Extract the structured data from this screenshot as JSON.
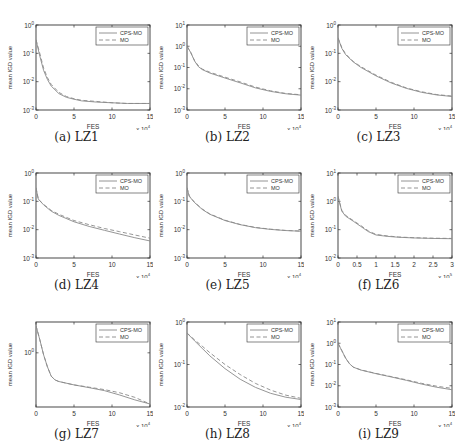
{
  "figure": {
    "line_colors": {
      "CPS-MO": "#8a8a8a",
      "MO": "#8a8a8a"
    },
    "axis_color": "#333333"
  },
  "chart_data": [
    {
      "id": "LZ1",
      "caption": "(a) LZ1",
      "type": "line",
      "xlabel": "FES",
      "ylabel": "mean IGD value",
      "x_multiplier": "x 10^4",
      "xlim": [
        0,
        15
      ],
      "xticks": [
        0,
        5,
        10,
        15
      ],
      "yscale": "log",
      "ylim": [
        0.001,
        1
      ],
      "yticks": [
        "10^0",
        "10^-1",
        "10^-2",
        "10^-3"
      ],
      "legend": [
        "CPS-MO",
        "MO"
      ],
      "legend_position": "upper right",
      "x": [
        0,
        0.5,
        1,
        1.5,
        2,
        3,
        4,
        5,
        6,
        8,
        10,
        12,
        15
      ],
      "series": [
        {
          "name": "CPS-MO",
          "style": "solid",
          "values": [
            0.3,
            0.08,
            0.025,
            0.012,
            0.007,
            0.0038,
            0.0028,
            0.0024,
            0.0021,
            0.0019,
            0.0018,
            0.0017,
            0.0017
          ]
        },
        {
          "name": "MO",
          "style": "dashed",
          "values": [
            0.3,
            0.1,
            0.03,
            0.014,
            0.008,
            0.0042,
            0.003,
            0.0025,
            0.0022,
            0.002,
            0.0018,
            0.0017,
            0.0017
          ]
        }
      ]
    },
    {
      "id": "LZ2",
      "caption": "(b) LZ2",
      "type": "line",
      "xlabel": "FES",
      "ylabel": "mean IGD value",
      "x_multiplier": "x 10^4",
      "xlim": [
        0,
        15
      ],
      "xticks": [
        0,
        5,
        10,
        15
      ],
      "yscale": "log",
      "ylim": [
        0.001,
        10
      ],
      "yticks": [
        "10^1",
        "10^0",
        "10^-1",
        "10^-2",
        "10^-3"
      ],
      "legend": [
        "CPS-MO",
        "MO"
      ],
      "legend_position": "upper right",
      "x": [
        0,
        0.5,
        1,
        1.5,
        2,
        3,
        5,
        7,
        9,
        11,
        13,
        15
      ],
      "series": [
        {
          "name": "CPS-MO",
          "style": "solid",
          "values": [
            1.0,
            0.5,
            0.2,
            0.11,
            0.08,
            0.055,
            0.032,
            0.019,
            0.011,
            0.0075,
            0.0058,
            0.005
          ]
        },
        {
          "name": "MO",
          "style": "dashed",
          "values": [
            1.0,
            0.5,
            0.21,
            0.12,
            0.085,
            0.06,
            0.035,
            0.021,
            0.012,
            0.008,
            0.006,
            0.0052
          ]
        }
      ]
    },
    {
      "id": "LZ3",
      "caption": "(c) LZ3",
      "type": "line",
      "xlabel": "FES",
      "ylabel": "mean IGD value",
      "x_multiplier": "x 10^4",
      "xlim": [
        0,
        15
      ],
      "xticks": [
        0,
        5,
        10,
        15
      ],
      "yscale": "log",
      "ylim": [
        0.001,
        1
      ],
      "yticks": [
        "10^0",
        "10^-1",
        "10^-2",
        "10^-3"
      ],
      "legend": [
        "CPS-MO",
        "MO"
      ],
      "legend_position": "upper right",
      "x": [
        0,
        0.5,
        1,
        2,
        3,
        5,
        7,
        9,
        11,
        13,
        15
      ],
      "series": [
        {
          "name": "CPS-MO",
          "style": "solid",
          "values": [
            0.35,
            0.15,
            0.09,
            0.05,
            0.032,
            0.016,
            0.009,
            0.0058,
            0.0042,
            0.0034,
            0.003
          ]
        },
        {
          "name": "MO",
          "style": "dashed",
          "values": [
            0.35,
            0.16,
            0.095,
            0.052,
            0.034,
            0.017,
            0.0095,
            0.006,
            0.0044,
            0.0035,
            0.0031
          ]
        }
      ]
    },
    {
      "id": "LZ4",
      "caption": "(d) LZ4",
      "type": "line",
      "xlabel": "FES",
      "ylabel": "mean IGD value",
      "x_multiplier": "x 10^4",
      "xlim": [
        0,
        15
      ],
      "xticks": [
        0,
        5,
        10,
        15
      ],
      "yscale": "log",
      "ylim": [
        0.001,
        1
      ],
      "yticks": [
        "10^0",
        "10^-1",
        "10^-2",
        "10^-3"
      ],
      "legend": [
        "CPS-MO",
        "MO"
      ],
      "legend_position": "upper right",
      "x": [
        0,
        0.3,
        1,
        2,
        3,
        5,
        7,
        9,
        11,
        13,
        15
      ],
      "series": [
        {
          "name": "CPS-MO",
          "style": "solid",
          "values": [
            0.3,
            0.12,
            0.075,
            0.045,
            0.032,
            0.019,
            0.013,
            0.0095,
            0.007,
            0.0052,
            0.004
          ]
        },
        {
          "name": "MO",
          "style": "dashed",
          "values": [
            0.3,
            0.12,
            0.078,
            0.048,
            0.035,
            0.021,
            0.015,
            0.011,
            0.0085,
            0.0065,
            0.005
          ]
        }
      ]
    },
    {
      "id": "LZ5",
      "caption": "(e) LZ5",
      "type": "line",
      "xlabel": "FES",
      "ylabel": "mean IGD value",
      "x_multiplier": "x 10^4",
      "xlim": [
        0,
        15
      ],
      "xticks": [
        0,
        5,
        10,
        15
      ],
      "yscale": "log",
      "ylim": [
        0.001,
        1
      ],
      "yticks": [
        "10^0",
        "10^-1",
        "10^-2",
        "10^-3"
      ],
      "legend": [
        "CPS-MO",
        "MO"
      ],
      "legend_position": "upper right",
      "x": [
        0,
        0.3,
        1,
        2,
        3,
        5,
        7,
        9,
        11,
        13,
        15
      ],
      "series": [
        {
          "name": "CPS-MO",
          "style": "solid",
          "values": [
            0.3,
            0.15,
            0.09,
            0.052,
            0.035,
            0.021,
            0.015,
            0.0118,
            0.0102,
            0.0093,
            0.0088
          ]
        },
        {
          "name": "MO",
          "style": "dashed",
          "values": [
            0.3,
            0.155,
            0.092,
            0.054,
            0.036,
            0.0215,
            0.0153,
            0.012,
            0.0104,
            0.0094,
            0.0089
          ]
        }
      ]
    },
    {
      "id": "LZ6",
      "caption": "(f) LZ6",
      "type": "line",
      "xlabel": "FES",
      "ylabel": "mean IGD value",
      "x_multiplier": "x 10^5",
      "xlim": [
        0,
        3
      ],
      "xticks": [
        0,
        0.5,
        1,
        1.5,
        2,
        2.5,
        3
      ],
      "yscale": "log",
      "ylim": [
        0.01,
        10
      ],
      "yticks": [
        "10^1",
        "10^0",
        "10^-1",
        "10^-2"
      ],
      "legend": [
        "CPS-MO",
        "MO"
      ],
      "legend_position": "upper right",
      "x": [
        0,
        0.05,
        0.1,
        0.2,
        0.4,
        0.6,
        0.8,
        1.0,
        1.3,
        1.6,
        2.0,
        2.5,
        3.0
      ],
      "series": [
        {
          "name": "CPS-MO",
          "style": "solid",
          "values": [
            1.5,
            0.8,
            0.45,
            0.3,
            0.2,
            0.13,
            0.085,
            0.065,
            0.058,
            0.054,
            0.051,
            0.049,
            0.048
          ]
        },
        {
          "name": "MO",
          "style": "dashed",
          "values": [
            1.5,
            0.85,
            0.48,
            0.32,
            0.21,
            0.14,
            0.09,
            0.068,
            0.06,
            0.055,
            0.052,
            0.05,
            0.049
          ]
        }
      ]
    },
    {
      "id": "LZ7",
      "caption": "(g) LZ7",
      "type": "line",
      "xlabel": "FES",
      "ylabel": "mean IGD value",
      "x_multiplier": "x 10^4",
      "xlim": [
        0,
        15
      ],
      "xticks": [
        0,
        5,
        10,
        15
      ],
      "yscale": "log",
      "ylim": [
        0.25,
        2.2
      ],
      "yticks": [
        "10^0"
      ],
      "legend": [
        "CPS-MO",
        "MO"
      ],
      "legend_position": "upper right",
      "x": [
        0,
        0.5,
        1,
        1.5,
        2,
        2.5,
        3,
        5,
        7,
        9,
        11,
        13,
        15
      ],
      "series": [
        {
          "name": "CPS-MO",
          "style": "solid",
          "values": [
            2.0,
            1.4,
            0.95,
            0.7,
            0.55,
            0.5,
            0.48,
            0.44,
            0.41,
            0.38,
            0.34,
            0.3,
            0.27
          ]
        },
        {
          "name": "MO",
          "style": "dashed",
          "values": [
            2.0,
            1.4,
            0.95,
            0.7,
            0.55,
            0.5,
            0.48,
            0.44,
            0.415,
            0.39,
            0.36,
            0.32,
            0.27
          ]
        }
      ]
    },
    {
      "id": "LZ8",
      "caption": "(h) LZ8",
      "type": "line",
      "xlabel": "FES",
      "ylabel": "mean IGD value",
      "x_multiplier": "x 10^4",
      "xlim": [
        0,
        15
      ],
      "xticks": [
        0,
        5,
        10,
        15
      ],
      "yscale": "log",
      "ylim": [
        0.01,
        1
      ],
      "yticks": [
        "10^0",
        "10^-1",
        "10^-2"
      ],
      "legend": [
        "CPS-MO",
        "MO"
      ],
      "legend_position": "upper right",
      "x": [
        0,
        1,
        2,
        3,
        5,
        7,
        9,
        11,
        13,
        15
      ],
      "series": [
        {
          "name": "CPS-MO",
          "style": "solid",
          "values": [
            0.55,
            0.36,
            0.24,
            0.16,
            0.08,
            0.045,
            0.029,
            0.021,
            0.017,
            0.015
          ]
        },
        {
          "name": "MO",
          "style": "dashed",
          "values": [
            0.55,
            0.38,
            0.27,
            0.19,
            0.1,
            0.058,
            0.036,
            0.025,
            0.019,
            0.016
          ]
        }
      ]
    },
    {
      "id": "LZ9",
      "caption": "(i) LZ9",
      "type": "line",
      "xlabel": "FES",
      "ylabel": "mean IGD value",
      "x_multiplier": "x 10^4",
      "xlim": [
        0,
        15
      ],
      "xticks": [
        0,
        5,
        10,
        15
      ],
      "yscale": "log",
      "ylim": [
        0.001,
        10
      ],
      "yticks": [
        "10^1",
        "10^0",
        "10^-1",
        "10^-2",
        "10^-3"
      ],
      "legend": [
        "CPS-MO",
        "MO"
      ],
      "legend_position": "upper right",
      "x": [
        0,
        0.5,
        1,
        1.5,
        2,
        3,
        5,
        7,
        9,
        11,
        13,
        15
      ],
      "series": [
        {
          "name": "CPS-MO",
          "style": "solid",
          "values": [
            1.0,
            0.45,
            0.2,
            0.11,
            0.075,
            0.055,
            0.037,
            0.026,
            0.018,
            0.012,
            0.0085,
            0.0065
          ]
        },
        {
          "name": "MO",
          "style": "dashed",
          "values": [
            1.0,
            0.45,
            0.2,
            0.11,
            0.076,
            0.056,
            0.038,
            0.027,
            0.019,
            0.013,
            0.0095,
            0.0075
          ]
        }
      ]
    }
  ]
}
